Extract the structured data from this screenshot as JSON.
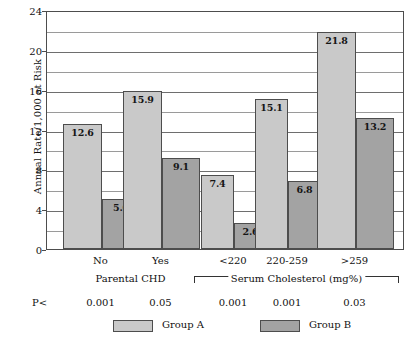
{
  "chart_data": {
    "type": "bar",
    "title": "",
    "xlabel": "",
    "ylabel": "Annual Rate/1,000 at Risk",
    "ylim": [
      0,
      24
    ],
    "ytick_labels": [
      "0",
      "4",
      "8",
      "12",
      "16",
      "20",
      "24"
    ],
    "ytick_values": [
      0,
      4,
      8,
      12,
      16,
      20,
      24
    ],
    "minor_gridline_values": [
      2,
      6,
      10,
      14,
      18,
      22
    ],
    "grid": true,
    "legend_position": "bottom",
    "categories": [
      "No",
      "Yes",
      "<220",
      "220-259",
      ">259"
    ],
    "series": [
      {
        "name": "Group A",
        "color": "#c9c9c9",
        "values": [
          12.6,
          15.9,
          7.4,
          15.1,
          21.8
        ]
      },
      {
        "name": "Group B",
        "color": "#a3a3a3",
        "values": [
          5.0,
          9.1,
          2.6,
          6.8,
          13.2
        ]
      }
    ],
    "value_labels": [
      [
        "12.6",
        "15.9",
        "7.4",
        "15.1",
        "21.8"
      ],
      [
        "5.0",
        "9.1",
        "2.6",
        "6.8",
        "13.2"
      ]
    ],
    "groups": [
      {
        "label": "Parental CHD",
        "categories": [
          "No",
          "Yes"
        ],
        "bracket": false
      },
      {
        "label": "Serum Cholesterol (mg%)",
        "categories": [
          "<220",
          "220-259",
          ">259"
        ],
        "bracket": true
      }
    ],
    "annotations": {
      "p_row_label": "P<",
      "p_values": [
        "0.001",
        "0.05",
        "0.001",
        "0.001",
        "0.03"
      ]
    }
  },
  "legend": {
    "items": [
      {
        "label": "Group A",
        "color": "#c9c9c9"
      },
      {
        "label": "Group B",
        "color": "#a3a3a3"
      }
    ]
  },
  "axis": {
    "y_title": "Annual Rate/1,000 at Risk"
  }
}
